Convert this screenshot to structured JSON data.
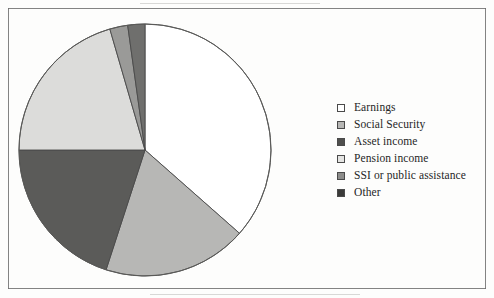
{
  "figure": {
    "border_color": "#6d6d6d",
    "background_color": "#fdfdfc"
  },
  "chart_data": {
    "type": "pie",
    "title": "",
    "subtitle": "",
    "xlabel": "",
    "ylabel": "",
    "grid": false,
    "legend_position": "right",
    "start_angle_deg": 0,
    "direction": "clockwise",
    "center": {
      "cx": 127,
      "cy": 127,
      "r": 126
    },
    "categories": [
      "Earnings",
      "Social Security",
      "Asset income",
      "Pension income",
      "SSI or public assistance",
      "Other"
    ],
    "values": [
      36.5,
      18.5,
      20.0,
      20.5,
      2.3,
      2.2
    ],
    "units": "percent",
    "slices": [
      {
        "label": "Earnings",
        "value": 36.5,
        "start_deg": 0,
        "end_deg": 131.4,
        "color": "#ffffff",
        "stroke": "#4a4a4a"
      },
      {
        "label": "Social Security",
        "value": 18.5,
        "start_deg": 131.4,
        "end_deg": 198.0,
        "color": "#b7b7b5",
        "stroke": "#4a4a4a"
      },
      {
        "label": "Asset income",
        "value": 20.0,
        "start_deg": 198.0,
        "end_deg": 270.0,
        "color": "#5b5b59",
        "stroke": "#4a4a4a"
      },
      {
        "label": "Pension income",
        "value": 20.5,
        "start_deg": 270.0,
        "end_deg": 343.8,
        "color": "#dcdcda",
        "stroke": "#4a4a4a"
      },
      {
        "label": "SSI or public assistance",
        "value": 2.3,
        "start_deg": 343.8,
        "end_deg": 352.1,
        "color": "#9a9a98",
        "stroke": "#4a4a4a"
      },
      {
        "label": "Other",
        "value": 2.2,
        "start_deg": 352.1,
        "end_deg": 360.0,
        "color": "#6f6f6d",
        "stroke": "#4a4a4a"
      }
    ]
  },
  "legend": {
    "items": [
      {
        "label": "Earnings",
        "swatch_color": "#ffffff",
        "swatch_name": "legend-swatch-earnings"
      },
      {
        "label": "Social Security",
        "swatch_color": "#b7b7b5",
        "swatch_name": "legend-swatch-social-security"
      },
      {
        "label": "Asset income",
        "swatch_color": "#4f4f4d",
        "swatch_name": "legend-swatch-asset-income"
      },
      {
        "label": "Pension income",
        "swatch_color": "#e4e4e2",
        "swatch_name": "legend-swatch-pension-income"
      },
      {
        "label": "SSI or public assistance",
        "swatch_color": "#8d8d8b",
        "swatch_name": "legend-swatch-ssi-public-assistance"
      },
      {
        "label": "Other",
        "swatch_color": "#3a3a38",
        "swatch_name": "legend-swatch-other"
      }
    ]
  }
}
